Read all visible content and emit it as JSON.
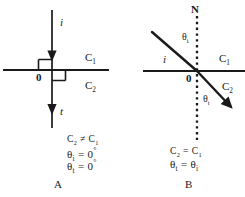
{
  "figure": {
    "title": "",
    "stroke_color": "#1a1a1a",
    "background": "#ffffff",
    "panels": [
      {
        "id": "A",
        "letter": "A",
        "incident_ray_label": "i",
        "transmitted_ray_label": "t",
        "origin_label": "0",
        "medium_upper_label": "C",
        "medium_upper_sub": "1",
        "medium_lower_label": "C",
        "medium_lower_sub": "2",
        "conditions": [
          {
            "lhs": "C",
            "lhs_sub": "2",
            "op": "≠",
            "rhs": "C",
            "rhs_sub": "1"
          },
          {
            "lhs": "θ",
            "lhs_sub": "i",
            "op": "=",
            "rhs": "0",
            "rhs_sup": "°"
          },
          {
            "lhs": "θ",
            "lhs_sub": "t",
            "op": "=",
            "rhs": "0",
            "rhs_sup": "°"
          }
        ]
      },
      {
        "id": "B",
        "letter": "B",
        "normal_label": "N",
        "incident_ray_label": "i",
        "origin_label": "0",
        "angle_incidence_label": "θ",
        "angle_incidence_sub": "i",
        "angle_transmission_label": "θ",
        "angle_transmission_sub": "t",
        "medium_upper_label": "C",
        "medium_upper_sub": "1",
        "medium_lower_label": "C",
        "medium_lower_sub": "2",
        "conditions": [
          {
            "lhs": "C",
            "lhs_sub": "2",
            "op": "=",
            "rhs": "C",
            "rhs_sub": "1"
          },
          {
            "lhs": "θ",
            "lhs_sub": "t",
            "op": "=",
            "rhs": "θ",
            "rhs_sub": "i"
          }
        ]
      }
    ]
  }
}
